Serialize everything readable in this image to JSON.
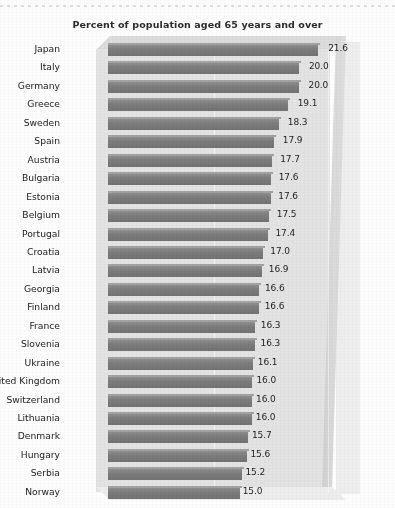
{
  "chart_data": {
    "type": "bar",
    "orientation": "horizontal",
    "title": "Percent of population aged 65 years and over",
    "xlabel": "",
    "ylabel": "",
    "xlim": [
      0,
      23
    ],
    "grid": false,
    "legend": null,
    "value_labels": true,
    "categories": [
      "Japan",
      "Italy",
      "Germany",
      "Greece",
      "Sweden",
      "Spain",
      "Austria",
      "Bulgaria",
      "Estonia",
      "Belgium",
      "Portugal",
      "Croatia",
      "Latvia",
      "Georgia",
      "Finland",
      "France",
      "Slovenia",
      "Ukraine",
      "United Kingdom",
      "Switzerland",
      "Lithuania",
      "Denmark",
      "Hungary",
      "Serbia",
      "Norway"
    ],
    "values": [
      21.6,
      20.0,
      20.0,
      19.1,
      18.3,
      17.9,
      17.7,
      17.6,
      17.6,
      17.5,
      17.4,
      17.0,
      16.9,
      16.6,
      16.6,
      16.3,
      16.3,
      16.1,
      16.0,
      16.0,
      16.0,
      15.7,
      15.6,
      15.2,
      15.0
    ],
    "value_label_texts": [
      "21.6",
      "20.0",
      "20.0",
      "19.1",
      "18.3",
      "17.9",
      "17.7",
      "17.6",
      "17.6",
      "17.5",
      "17.4",
      "17.0",
      "16.9",
      "16.6",
      "16.6",
      "16.3",
      "16.3",
      "16.1",
      "16.0",
      "16.0",
      "16.0",
      "15.7",
      "15.6",
      "15.2",
      "15.0"
    ]
  },
  "colors": {
    "bar": "#7c7c7c",
    "plot_background": "#e3e3e3",
    "page_background": "#fdfdfd",
    "text": "#222222"
  }
}
